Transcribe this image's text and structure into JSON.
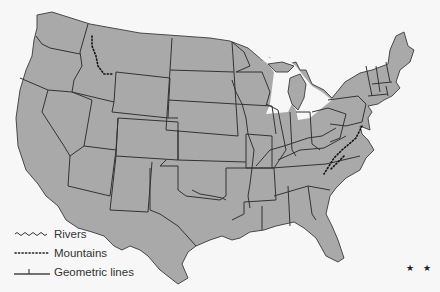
{
  "map": {
    "subject": "Contiguous United States state boundaries",
    "land_color": "#a9a9a9",
    "border_color": "#333333",
    "background_color": "#f7f7f7"
  },
  "legend": {
    "items": [
      {
        "symbol": "wavy-line",
        "label": "Rivers"
      },
      {
        "symbol": "dotted-line",
        "label": "Mountains"
      },
      {
        "symbol": "tick-line",
        "label": "Geometric lines"
      }
    ]
  },
  "marker": {
    "text": "★ ★"
  }
}
